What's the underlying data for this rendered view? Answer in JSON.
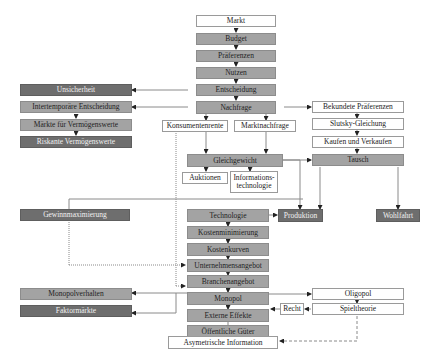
{
  "diagram": {
    "type": "flowchart",
    "title": "",
    "nodes": {
      "markt": "Markt",
      "budget": "Budget",
      "praeferenzen": "Präferenzen",
      "nutzen": "Nutzen",
      "entscheidung": "Entscheidung",
      "nachfrage": "Nachfrage",
      "unsicherheit": "Unsicherheit",
      "intertemporaere": "Intertemporäre Entscheidung",
      "maerkte_vermoegen": "Märkte für Vermögenswerte",
      "riskante_vermoegen": "Riskante Vermögenswerte",
      "konsumentenrente": "Konsumentenrente",
      "marktnachfrage": "Marktnachfrage",
      "bekundete": "Bekundete Präferenzen",
      "slutsky": "Slutsky-Gleichung",
      "kaufen": "Kaufen und Verkaufen",
      "tausch": "Tausch",
      "gleichgewicht": "Gleichgewicht",
      "auktionen": "Auktionen",
      "informationstechnologie_1": "Informations-",
      "informationstechnologie_2": "technologie",
      "gewinnmax": "Gewinnmaximierung",
      "technologie": "Technologie",
      "produktion": "Produktion",
      "wohlfahrt": "Wohlfahrt",
      "kostenmin": "Kostenminimierung",
      "kostenkurven": "Kostenkurven",
      "unternehmensangebot": "Unternehmensangebot",
      "branchenangebot": "Branchenangebot",
      "monopol": "Monopol",
      "monopolverhalten": "Monopolverhalten",
      "faktormaerkte": "Faktormärkte",
      "oligopol": "Oligopol",
      "externe": "Externe Effekte",
      "recht": "Recht",
      "spieltheorie": "Spieltheorie",
      "oeffentliche": "Öffentliche Güter",
      "asymetrische": "Asymetrische Information"
    },
    "colors": {
      "white_box": "#ffffff",
      "medium_box": "#a3a3a3",
      "dark_box": "#6e6e6e",
      "line": "#8a8a8a",
      "arrow": "#222222"
    }
  }
}
